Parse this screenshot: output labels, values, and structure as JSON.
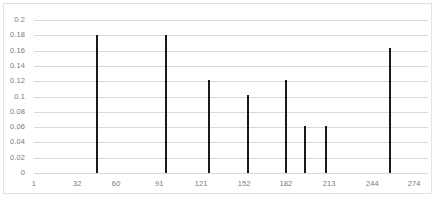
{
  "chart_data": {
    "type": "bar",
    "title": "",
    "subtitle": "",
    "xlabel": "",
    "ylabel": "",
    "grid": "horizontal",
    "legend": "none",
    "xlim": [
      1,
      284
    ],
    "ylim": [
      0,
      0.2
    ],
    "ytick_labels": [
      "0.2",
      "0.18",
      "0.16",
      "0.14",
      "0.12",
      "0.1",
      "0.08",
      "0.06",
      "0.04",
      "0.02",
      "0"
    ],
    "ytick_values": [
      0.2,
      0.18,
      0.16,
      0.14,
      0.12,
      0.1,
      0.08,
      0.06,
      0.04,
      0.02,
      0
    ],
    "xtick_labels": [
      "1",
      "32",
      "60",
      "91",
      "121",
      "152",
      "182",
      "213",
      "244",
      "274"
    ],
    "xtick_values": [
      1,
      32,
      60,
      91,
      121,
      152,
      182,
      213,
      244,
      274
    ],
    "x": [
      46,
      96,
      127,
      155,
      182,
      196,
      211,
      257
    ],
    "values": [
      0.181,
      0.181,
      0.122,
      0.102,
      0.122,
      0.062,
      0.062,
      0.163
    ],
    "series": [
      {
        "name": "",
        "color": "#1a1a1a",
        "points": [
          {
            "x": 46,
            "y": 0.181
          },
          {
            "x": 96,
            "y": 0.181
          },
          {
            "x": 127,
            "y": 0.122
          },
          {
            "x": 155,
            "y": 0.102
          },
          {
            "x": 182,
            "y": 0.122
          },
          {
            "x": 196,
            "y": 0.062
          },
          {
            "x": 211,
            "y": 0.062
          },
          {
            "x": 257,
            "y": 0.163
          }
        ]
      }
    ]
  },
  "style": {
    "bar_color": "#1a1a1a",
    "gridline_color": "#d9d9d9",
    "axis_label_color": "#7b7b7b",
    "plot_background": "#ffffff",
    "frame_border_color": "#e2e2e2"
  }
}
